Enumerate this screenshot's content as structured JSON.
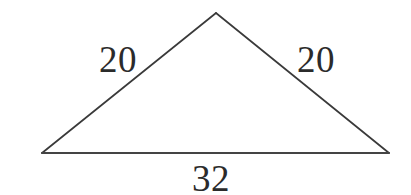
{
  "figure": {
    "kind": "geometry-diagram",
    "shape_name": "isosceles triangle",
    "background_color": "#ffffff",
    "stroke_color": "#3a3a3a",
    "base_stroke_color": "#444444",
    "text_color": "#2b2b2b"
  },
  "chart_data": {
    "type": "diagram",
    "title": "",
    "xlabel": "",
    "ylabel": "",
    "shape": "triangle",
    "vertices": [
      {
        "name": "apex",
        "x": 216,
        "y": 13
      },
      {
        "name": "bottom-left",
        "x": 42,
        "y": 153
      },
      {
        "name": "bottom-right",
        "x": 389,
        "y": 153
      }
    ],
    "edges": [
      {
        "name": "left-side",
        "from": "bottom-left",
        "to": "apex",
        "label": "20"
      },
      {
        "name": "right-side",
        "from": "apex",
        "to": "bottom-right",
        "label": "20"
      },
      {
        "name": "base",
        "from": "bottom-left",
        "to": "bottom-right",
        "label": "32"
      }
    ],
    "labels": [
      {
        "name": "left-side-length",
        "text": "20",
        "x": 118,
        "y": 59
      },
      {
        "name": "right-side-length",
        "text": "20",
        "x": 316,
        "y": 59
      },
      {
        "name": "base-length",
        "text": "32",
        "x": 211,
        "y": 177
      }
    ],
    "values": [
      20,
      20,
      32
    ],
    "categories": [
      "left side",
      "right side",
      "base"
    ],
    "grid": false,
    "legend": false
  },
  "labels": {
    "left_side": "20",
    "right_side": "20",
    "base": "32"
  }
}
